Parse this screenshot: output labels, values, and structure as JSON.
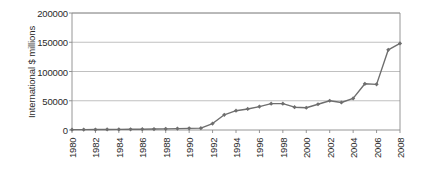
{
  "chart": {
    "type": "line",
    "axis_color": "#8a8a8a",
    "grid_color": "#b9b9b9",
    "series_color": "#6e6e6e",
    "text_color": "#2a2a2a",
    "background": "#ffffff"
  },
  "chart_data": {
    "type": "line",
    "title": "",
    "subtitle": "",
    "xlabel": "",
    "ylabel": "International $ millions",
    "ylim": [
      0,
      200000
    ],
    "xlim": [
      1980,
      2008
    ],
    "ytick_labels": [
      "0",
      "50000",
      "100000",
      "150000",
      "200000"
    ],
    "ytick_values": [
      0,
      50000,
      100000,
      150000,
      200000
    ],
    "xtick_labels": [
      "1980",
      "1982",
      "1984",
      "1986",
      "1988",
      "1990",
      "1992",
      "1994",
      "1996",
      "1998",
      "2000",
      "2002",
      "2004",
      "2006",
      "2008"
    ],
    "xtick_values": [
      1980,
      1982,
      1984,
      1986,
      1988,
      1990,
      1992,
      1994,
      1996,
      1998,
      2000,
      2002,
      2004,
      2006,
      2008
    ],
    "grid": "horizontal",
    "legend": "none",
    "marker": "diamond",
    "x": [
      1980,
      1981,
      1982,
      1983,
      1984,
      1985,
      1986,
      1987,
      1988,
      1989,
      1990,
      1991,
      1992,
      1993,
      1994,
      1995,
      1996,
      1997,
      1998,
      1999,
      2000,
      2001,
      2002,
      2003,
      2004,
      2005,
      2006,
      2007,
      2008
    ],
    "series": [
      {
        "name": "International $ millions",
        "values": [
          600,
          700,
          800,
          900,
          1000,
          1200,
          1400,
          1600,
          2000,
          2400,
          2800,
          3200,
          11000,
          26000,
          33000,
          36000,
          40000,
          45000,
          45000,
          39000,
          38000,
          44000,
          50000,
          47000,
          54000,
          79000,
          78000,
          137000,
          148000
        ]
      }
    ]
  }
}
